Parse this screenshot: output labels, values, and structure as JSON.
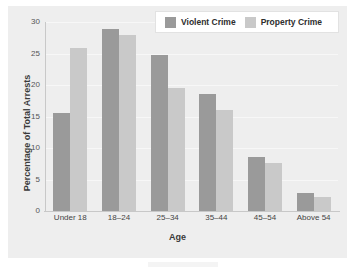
{
  "chart_data": {
    "type": "bar",
    "title": "",
    "xlabel": "Age",
    "ylabel": "Percentage of Total Arrests",
    "categories": [
      "Under 18",
      "18–24",
      "25–34",
      "35–44",
      "45–54",
      "Above 54"
    ],
    "series": [
      {
        "name": "Violent Crime",
        "color": "#9a9a9a",
        "values": [
          15.5,
          28.9,
          24.8,
          18.6,
          8.6,
          2.8
        ]
      },
      {
        "name": "Property Crime",
        "color": "#c9c9c9",
        "values": [
          25.9,
          28.0,
          19.6,
          16.0,
          7.6,
          2.3
        ]
      }
    ],
    "ylim": [
      0,
      30
    ],
    "yticks": [
      0,
      5,
      10,
      15,
      20,
      25,
      30
    ],
    "ytick_labels": [
      "0",
      "5",
      "10",
      "15",
      "20",
      "25",
      "30"
    ],
    "grid": true,
    "legend_position": "top-right",
    "panel_background": "#eeeeee",
    "figure_background": "#ffffff"
  }
}
